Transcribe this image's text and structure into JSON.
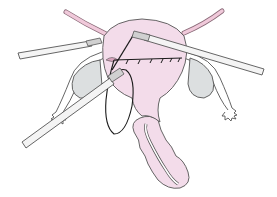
{
  "figure": {
    "description": "Laparoscopic suturing of uterine incision with three instruments",
    "colors": {
      "background": "#ffffff",
      "uterus_fill": "#f3dcea",
      "outline": "#555555",
      "ovary_fill": "#dcdfe0",
      "tube_ligament": "#e8b7cc",
      "instrument_fill": "#f4f4f4",
      "suture": "#1a1a1a",
      "incision_fill": "#d9a3bd"
    },
    "elements": [
      "uterus",
      "round-ligament-left",
      "round-ligament-right",
      "ovary-left",
      "ovary-right",
      "fallopian-tube-left",
      "fallopian-tube-right",
      "vagina",
      "suture-line",
      "needle-holder-upper-left",
      "needle-holder-upper-right",
      "grasper-lower-left",
      "suture-thread-loop"
    ],
    "suture_stitch_count": 6
  }
}
